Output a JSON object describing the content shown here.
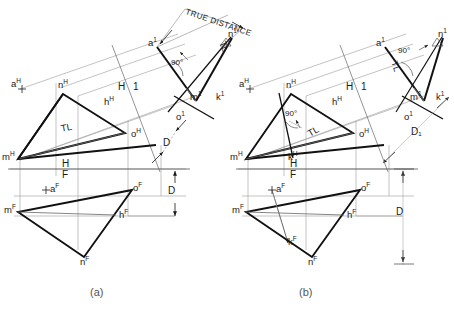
{
  "figure": {
    "captions": [
      {
        "id": "caption-a",
        "text": "(a)"
      },
      {
        "id": "caption-b",
        "text": "(b)"
      }
    ],
    "annotations": {
      "true_distance": "TRUE DISTANCE",
      "right_angle": "90°",
      "true_length": "TL",
      "fold_h": "H",
      "fold_f": "F",
      "fold_h1_h": "H",
      "fold_h1_1": "1",
      "dim_d": "D",
      "dim_d1": "D₁"
    },
    "colors": {
      "ink": "#1a1a1a",
      "thin": "#9a9a9a",
      "paper": "#ffffff",
      "caption": "#555555"
    }
  },
  "diagram_a": {
    "name": "diagram-a",
    "horizontal_view": {
      "points": [
        {
          "key": "m_h",
          "label": "m",
          "sup": "H"
        },
        {
          "key": "n_h",
          "label": "n",
          "sup": "H"
        },
        {
          "key": "h_h",
          "label": "h",
          "sup": "H"
        },
        {
          "key": "o_h",
          "label": "o",
          "sup": "H"
        },
        {
          "key": "a_h",
          "label": "a",
          "sup": "H"
        }
      ],
      "true_length_label": "TL"
    },
    "frontal_view": {
      "points": [
        {
          "key": "m_f",
          "label": "m",
          "sup": "F"
        },
        {
          "key": "n_f",
          "label": "n",
          "sup": "F"
        },
        {
          "key": "h_f",
          "label": "h",
          "sup": "F"
        },
        {
          "key": "o_f",
          "label": "o",
          "sup": "F"
        },
        {
          "key": "a_f",
          "label": "a",
          "sup": "F"
        }
      ]
    },
    "auxiliary_view": {
      "points": [
        {
          "key": "a_1",
          "label": "a",
          "sup": "1"
        },
        {
          "key": "n_1",
          "label": "n",
          "sup": "1"
        },
        {
          "key": "m_1",
          "label": "m",
          "sup": "1"
        },
        {
          "key": "k_1",
          "label": "k",
          "sup": "1"
        },
        {
          "key": "o_1",
          "label": "o",
          "sup": "1"
        }
      ],
      "true_length_label": "TL",
      "right_angle_label": "90°",
      "true_distance_label": "TRUE DISTANCE"
    },
    "fold_lines": [
      {
        "key": "hf",
        "upper": "H",
        "lower": "F"
      },
      {
        "key": "h1",
        "left": "H",
        "right": "1"
      }
    ],
    "dimensions": [
      {
        "key": "d_aux",
        "label": "D"
      },
      {
        "key": "d_front",
        "label": "D"
      }
    ]
  },
  "diagram_b": {
    "name": "diagram-b",
    "horizontal_view": {
      "points": [
        {
          "key": "m_h",
          "label": "m",
          "sup": "H"
        },
        {
          "key": "n_h",
          "label": "n",
          "sup": "H"
        },
        {
          "key": "h_h",
          "label": "h",
          "sup": "H"
        },
        {
          "key": "o_h",
          "label": "o",
          "sup": "H"
        },
        {
          "key": "a_h",
          "label": "a",
          "sup": "H"
        },
        {
          "key": "k_h",
          "label": "k",
          "sup": "H"
        }
      ],
      "true_length_label": "TL",
      "right_angle_label": "90°"
    },
    "frontal_view": {
      "points": [
        {
          "key": "m_f",
          "label": "m",
          "sup": "F"
        },
        {
          "key": "n_f",
          "label": "n",
          "sup": "F"
        },
        {
          "key": "h_f",
          "label": "h",
          "sup": "F"
        },
        {
          "key": "o_f",
          "label": "o",
          "sup": "F"
        },
        {
          "key": "a_f",
          "label": "a",
          "sup": "F"
        },
        {
          "key": "k_f",
          "label": "k",
          "sup": "F"
        }
      ]
    },
    "auxiliary_view": {
      "points": [
        {
          "key": "a_1",
          "label": "a",
          "sup": "1"
        },
        {
          "key": "n_1",
          "label": "n",
          "sup": "1"
        },
        {
          "key": "m_1",
          "label": "m",
          "sup": "1"
        },
        {
          "key": "k_1",
          "label": "k",
          "sup": "1"
        },
        {
          "key": "o_1",
          "label": "o",
          "sup": "1"
        }
      ],
      "true_length_label": "TL",
      "right_angle_label": "90°"
    },
    "fold_lines": [
      {
        "key": "hf",
        "upper": "H",
        "lower": "F"
      },
      {
        "key": "h1",
        "left": "H",
        "right": "1"
      }
    ],
    "dimensions": [
      {
        "key": "d1_aux",
        "label": "D₁"
      },
      {
        "key": "d_front",
        "label": "D"
      }
    ]
  }
}
